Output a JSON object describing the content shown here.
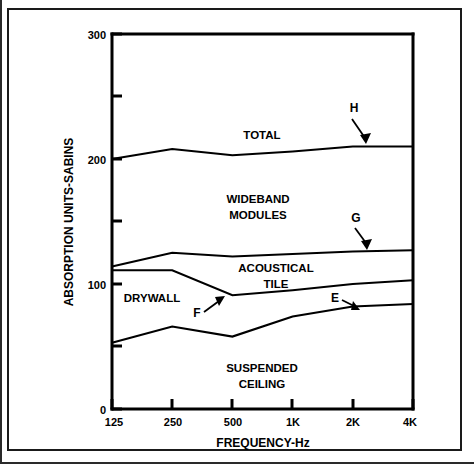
{
  "figure": {
    "background_color": "#ffffff",
    "line_color": "#000000",
    "border_color": "#1a1a1a"
  },
  "chart_data": {
    "type": "line",
    "title": "",
    "xlabel": "FREQUENCY-Hz",
    "ylabel": "ABSORPTION UNITS-SABINS",
    "categories": [
      "125",
      "250",
      "500",
      "1K",
      "2K",
      "4K"
    ],
    "x_tick_labels": [
      "125",
      "250",
      "500",
      "1K",
      "2K",
      "4K"
    ],
    "y_tick_labels": [
      "0",
      "100",
      "200",
      "300"
    ],
    "y_major_ticks": [
      0,
      100,
      200,
      300
    ],
    "y_minor_ticks": [
      50,
      150,
      250
    ],
    "ylim": [
      0,
      300
    ],
    "grid": false,
    "legend_position": "none",
    "series": [
      {
        "name": "H",
        "label": "TOTAL",
        "values": [
          200,
          208,
          203,
          206,
          210,
          210
        ]
      },
      {
        "name": "G",
        "label": "WIDEBAND MODULES",
        "values": [
          114,
          125,
          122,
          124,
          126,
          127
        ]
      },
      {
        "name": "F",
        "label": "ACOUSTICAL TILE",
        "values": [
          111,
          111,
          91,
          95,
          100,
          103
        ]
      },
      {
        "name": "E",
        "label": "SUSPENDED CEILING",
        "values": [
          53,
          66,
          58,
          74,
          82,
          84
        ]
      }
    ],
    "band_labels": [
      {
        "text": "TOTAL",
        "series": "H"
      },
      {
        "text_line1": "WIDEBAND",
        "text_line2": "MODULES",
        "series": "G"
      },
      {
        "text_line1": "ACOUSTICAL",
        "text_line2": "TILE",
        "series": "F"
      },
      {
        "text": "DRYWALL",
        "series": "F"
      },
      {
        "text_line1": "SUSPENDED",
        "text_line2": "CEILING",
        "series": "E"
      }
    ],
    "annotations": [
      {
        "label": "H",
        "points_to": "total-curve"
      },
      {
        "label": "G",
        "points_to": "wideband-modules-curve"
      },
      {
        "label": "F",
        "points_to": "acoustical-tile-curve"
      },
      {
        "label": "E",
        "points_to": "suspended-ceiling-curve"
      }
    ]
  },
  "labels": {
    "y_axis_title": "ABSORPTION UNITS-SABINS",
    "x_axis_title": "FREQUENCY-Hz",
    "y_tick_0": "0",
    "y_tick_100": "100",
    "y_tick_200": "200",
    "y_tick_300": "300",
    "x_tick_125": "125",
    "x_tick_250": "250",
    "x_tick_500": "500",
    "x_tick_1k": "1K",
    "x_tick_2k": "2K",
    "x_tick_4k": "4K",
    "band_total": "TOTAL",
    "band_wideband_1": "WIDEBAND",
    "band_wideband_2": "MODULES",
    "band_acoustical_1": "ACOUSTICAL",
    "band_acoustical_2": "TILE",
    "band_drywall": "DRYWALL",
    "band_suspended_1": "SUSPENDED",
    "band_suspended_2": "CEILING",
    "callout_h": "H",
    "callout_g": "G",
    "callout_f": "F",
    "callout_e": "E"
  }
}
